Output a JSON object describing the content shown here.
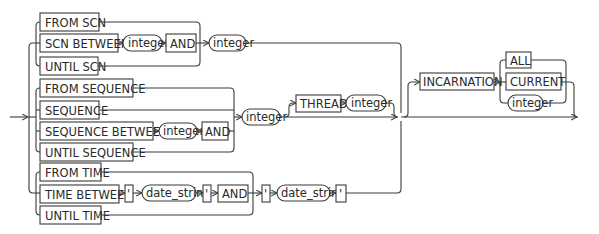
{
  "diagram": {
    "type": "railroad-syntax-diagram",
    "colors": {
      "line": "#3a3a3a",
      "text": "#2a2a2a",
      "background": "#ffffff"
    },
    "scn_group": {
      "from_scn": "FROM SCN",
      "scn_between": "SCN BETWEEN",
      "scn_integer1": "integer",
      "scn_and": "AND",
      "scn_integer2": "integer",
      "until_scn": "UNTIL SCN"
    },
    "sequence_group": {
      "from_sequence": "FROM SEQUENCE",
      "sequence": "SEQUENCE",
      "sequence_between": "SEQUENCE BETWEEN",
      "seq_integer1": "integer",
      "seq_and": "AND",
      "until_sequence": "UNTIL SEQUENCE",
      "seq_integer2": "integer",
      "thread": "THREAD",
      "thread_integer": "integer"
    },
    "time_group": {
      "from_time": "FROM TIME",
      "time_between": "TIME BETWEEN",
      "quote1": "'",
      "date_string1": "date_string",
      "quote2": "'",
      "time_and": "AND",
      "quote3": "'",
      "date_string2": "date_string",
      "quote4": "'",
      "until_time": "UNTIL TIME"
    },
    "incarnation_group": {
      "incarnation": "INCARNATION",
      "all": "ALL",
      "current": "CURRENT",
      "inc_integer": "integer"
    }
  }
}
